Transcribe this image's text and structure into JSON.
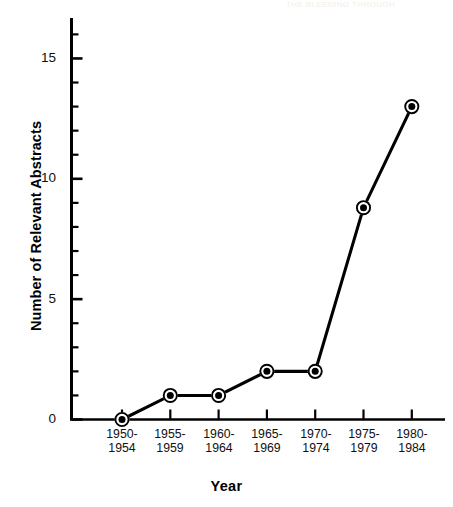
{
  "figure": {
    "background_color": "#ffffff",
    "ink_color": "#000000",
    "artifact_text": "THE BLEEDING THROUGH"
  },
  "chart_data": {
    "type": "line",
    "title": "",
    "subtitle": "",
    "xlabel": "Year",
    "ylabel": "Number of Relevant Abstracts",
    "categories": [
      "1950-1954",
      "1955-1959",
      "1960-1964",
      "1965-1969",
      "1970-1974",
      "1975-1979",
      "1980-1984"
    ],
    "category_lines": [
      [
        "1950-",
        "1954"
      ],
      [
        "1955-",
        "1959"
      ],
      [
        "1960-",
        "1964"
      ],
      [
        "1965-",
        "1969"
      ],
      [
        "1970-",
        "1974"
      ],
      [
        "1975-",
        "1979"
      ],
      [
        "1980-",
        "1984"
      ]
    ],
    "values": [
      0,
      1,
      1,
      2,
      2,
      8.8,
      13
    ],
    "series": [
      {
        "name": "Relevant Abstracts",
        "values": [
          0,
          1,
          1,
          2,
          2,
          8.8,
          13
        ]
      }
    ],
    "ylim": [
      0,
      16
    ],
    "y_major_ticks": [
      0,
      5,
      10,
      15
    ],
    "y_major_tick_labels": [
      "0",
      "5",
      "10",
      "15"
    ],
    "y_minor_tick_step": 1,
    "grid": false,
    "legend": "none",
    "marker": "bullseye-circle",
    "line_color": "#000000",
    "marker_fill_color": "#000000",
    "marker_ring_color": "#000000"
  }
}
